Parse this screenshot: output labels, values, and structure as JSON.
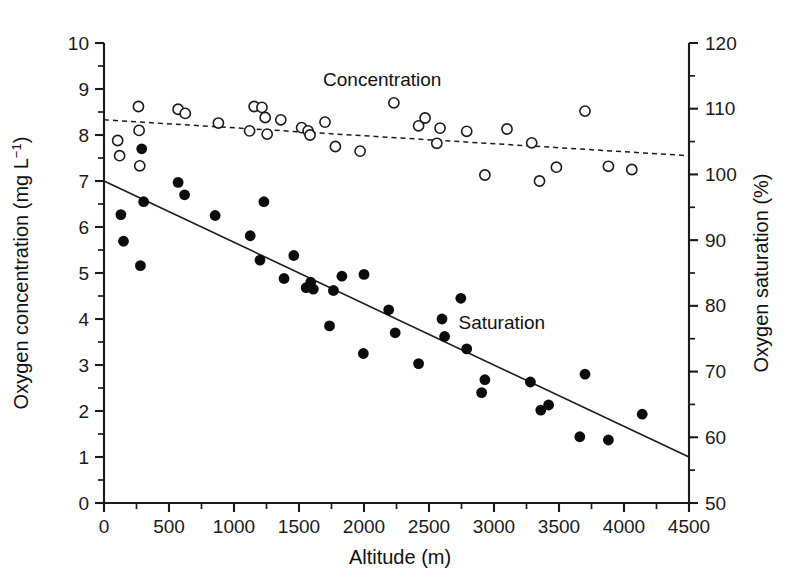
{
  "chart_data": {
    "type": "scatter",
    "title": "",
    "xlabel": "Altitude (m)",
    "ylabel": "Oxygen concentration (mg L−1)",
    "y2label": "Oxygen saturation (%)",
    "xlim": [
      0,
      4500
    ],
    "ylim": [
      0,
      10
    ],
    "y2lim": [
      50,
      120
    ],
    "xticks": [
      0,
      500,
      1000,
      1500,
      2000,
      2500,
      3000,
      3500,
      4000,
      4500
    ],
    "xtick_labels": [
      "0",
      "500",
      "1000",
      "1500",
      "2000",
      "2500",
      "3000",
      "3500",
      "4000",
      "4500"
    ],
    "yticks": [
      0,
      1,
      2,
      3,
      4,
      5,
      6,
      7,
      8,
      9,
      10
    ],
    "ytick_labels": [
      "0",
      "1",
      "2",
      "3",
      "4",
      "5",
      "6",
      "7",
      "8",
      "9",
      "10"
    ],
    "y2ticks": [
      50,
      60,
      70,
      80,
      90,
      100,
      110,
      120
    ],
    "y2tick_labels": [
      "50",
      "60",
      "70",
      "80",
      "90",
      "100",
      "110",
      "120"
    ],
    "yminor_step": 0.5,
    "y2minor_step": 5,
    "grid": false,
    "legend_position": "inline-annotations",
    "annotations": [
      {
        "text": "Concentration",
        "x": 2140,
        "y_right": 113.5,
        "marker": "open-circle"
      },
      {
        "text": "Saturation",
        "x": 3060,
        "y_right": 76.5,
        "marker": "filled-circle"
      }
    ],
    "series": [
      {
        "name": "Concentration",
        "marker": "open-circle",
        "axis": "left",
        "unit": "mg L-1",
        "points": [
          [
            105,
            7.88
          ],
          [
            120,
            7.55
          ],
          [
            265,
            8.62
          ],
          [
            270,
            8.1
          ],
          [
            275,
            7.33
          ],
          [
            570,
            8.56
          ],
          [
            625,
            8.47
          ],
          [
            880,
            8.26
          ],
          [
            1120,
            8.09
          ],
          [
            1155,
            8.62
          ],
          [
            1215,
            8.6
          ],
          [
            1240,
            8.38
          ],
          [
            1255,
            8.02
          ],
          [
            1360,
            8.33
          ],
          [
            1520,
            8.16
          ],
          [
            1570,
            8.09
          ],
          [
            1585,
            8.0
          ],
          [
            1700,
            8.28
          ],
          [
            1780,
            7.75
          ],
          [
            1970,
            7.65
          ],
          [
            2230,
            8.7
          ],
          [
            2420,
            8.2
          ],
          [
            2470,
            8.37
          ],
          [
            2560,
            7.82
          ],
          [
            2585,
            8.15
          ],
          [
            2790,
            8.08
          ],
          [
            2930,
            7.13
          ],
          [
            3100,
            8.13
          ],
          [
            3290,
            7.83
          ],
          [
            3350,
            7.0
          ],
          [
            3480,
            7.3
          ],
          [
            3700,
            8.52
          ],
          [
            3880,
            7.32
          ],
          [
            4060,
            7.25
          ]
        ]
      },
      {
        "name": "Saturation",
        "marker": "filled-circle",
        "axis": "right",
        "unit": "%",
        "points_left_axis": [
          [
            130,
            6.27
          ],
          [
            150,
            5.69
          ],
          [
            280,
            5.16
          ],
          [
            290,
            7.7
          ],
          [
            305,
            6.55
          ],
          [
            570,
            6.97
          ],
          [
            620,
            6.7
          ],
          [
            855,
            6.25
          ],
          [
            1125,
            5.81
          ],
          [
            1200,
            5.28
          ],
          [
            1230,
            6.55
          ],
          [
            1385,
            4.88
          ],
          [
            1460,
            5.38
          ],
          [
            1555,
            4.68
          ],
          [
            1590,
            4.8
          ],
          [
            1610,
            4.65
          ],
          [
            1735,
            3.85
          ],
          [
            1765,
            4.62
          ],
          [
            1830,
            4.93
          ],
          [
            1995,
            3.25
          ],
          [
            2000,
            4.97
          ],
          [
            2190,
            4.2
          ],
          [
            2240,
            3.7
          ],
          [
            2420,
            3.03
          ],
          [
            2600,
            4.0
          ],
          [
            2620,
            3.62
          ],
          [
            2745,
            4.45
          ],
          [
            2790,
            3.35
          ],
          [
            2905,
            2.4
          ],
          [
            2930,
            2.68
          ],
          [
            3280,
            2.63
          ],
          [
            3360,
            2.02
          ],
          [
            3420,
            2.13
          ],
          [
            3660,
            1.44
          ],
          [
            3700,
            2.8
          ],
          [
            3880,
            1.37
          ],
          [
            4140,
            1.93
          ]
        ]
      }
    ],
    "fits": [
      {
        "name": "Concentration trend",
        "style": "dashed",
        "axis": "left",
        "x_start": 0,
        "y_start": 8.33,
        "x_end": 4500,
        "y_end": 7.55
      },
      {
        "name": "Saturation trend",
        "style": "solid",
        "axis": "left",
        "x_start": 0,
        "y_start": 7.0,
        "x_end": 4500,
        "y_end": 1.0
      }
    ]
  }
}
